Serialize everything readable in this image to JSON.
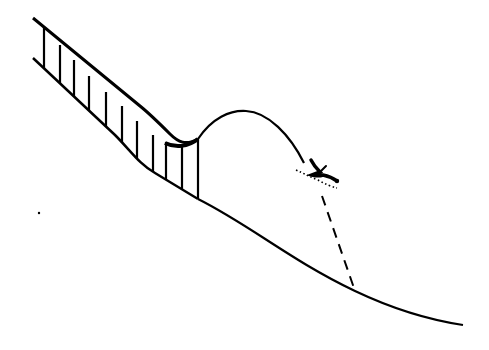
{
  "diagram": {
    "type": "ski-jump-illustration",
    "colors": {
      "stroke": "#000000",
      "background": "#ffffff"
    },
    "elements": [
      {
        "name": "inrun-ramp",
        "label": "Inrun ramp"
      },
      {
        "name": "ramp-supports",
        "label": "Support struts",
        "count": 12
      },
      {
        "name": "flight-trajectory",
        "label": "Flight path"
      },
      {
        "name": "skier",
        "label": "Skier"
      },
      {
        "name": "landing-hill",
        "label": "Landing slope"
      },
      {
        "name": "landing-projection",
        "label": "Dashed line to landing point"
      }
    ]
  }
}
